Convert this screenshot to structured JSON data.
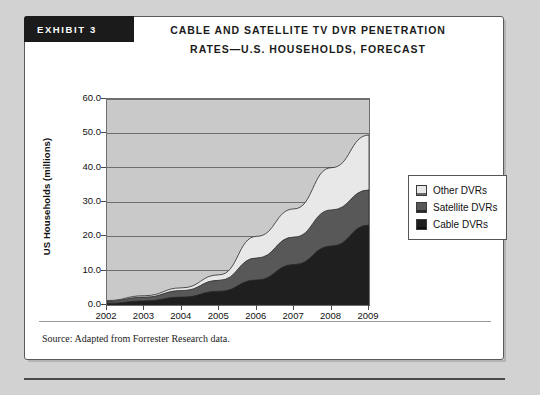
{
  "exhibit": {
    "banner_label": "EXHIBIT 3",
    "title_line_1": "CABLE AND SATELLITE TV DVR PENETRATION",
    "title_line_2": "RATES—U.S. HOUSEHOLDS, FORECAST"
  },
  "source": {
    "note": "Source: Adapted from Forrester Research data."
  },
  "colors": {
    "cable": "#1f1f1f",
    "satellite": "#585858",
    "other": "#e8e8e8",
    "plot_background": "#c9c9c9",
    "gridline": "#6e6e6e",
    "axis": "#4a4a4a",
    "banner": "#1b1b1b"
  },
  "legend": {
    "position": "right",
    "items": [
      {
        "label": "Other DVRs",
        "color": "#e8e8e8"
      },
      {
        "label": "Satellite DVRs",
        "color": "#585858"
      },
      {
        "label": "Cable DVRs",
        "color": "#1f1f1f"
      }
    ]
  },
  "chart_data": {
    "type": "area",
    "stacked": true,
    "title": "CABLE AND SATELLITE TV DVR PENETRATION RATES—U.S. HOUSEHOLDS, FORECAST",
    "xlabel": "",
    "ylabel": "US Households (millions)",
    "categories": [
      "2002",
      "2003",
      "2004",
      "2005",
      "2006",
      "2007",
      "2008",
      "2009"
    ],
    "x": [
      2002,
      2003,
      2004,
      2005,
      2006,
      2007,
      2008,
      2009
    ],
    "ylim": [
      0.0,
      60.0
    ],
    "yticks": [
      "0.0",
      "10.0",
      "20.0",
      "30.0",
      "40.0",
      "50.0",
      "60.0"
    ],
    "ytick_values": [
      0,
      10,
      20,
      30,
      40,
      50,
      60
    ],
    "grid": true,
    "series": [
      {
        "name": "Cable DVRs",
        "color": "#1f1f1f",
        "values": [
          0.5,
          1.2,
          2.3,
          4.0,
          7.3,
          11.8,
          17.2,
          23.3
        ]
      },
      {
        "name": "Satellite DVRs",
        "color": "#585858",
        "values": [
          0.6,
          1.1,
          1.9,
          3.2,
          6.4,
          8.0,
          10.5,
          10.2
        ]
      },
      {
        "name": "Other DVRs",
        "color": "#e8e8e8",
        "values": [
          0.2,
          0.4,
          0.8,
          1.6,
          6.3,
          8.2,
          12.3,
          16.0
        ]
      }
    ],
    "totals": [
      1.3,
      2.7,
      5.0,
      8.8,
      20.0,
      28.0,
      40.0,
      49.5
    ]
  }
}
